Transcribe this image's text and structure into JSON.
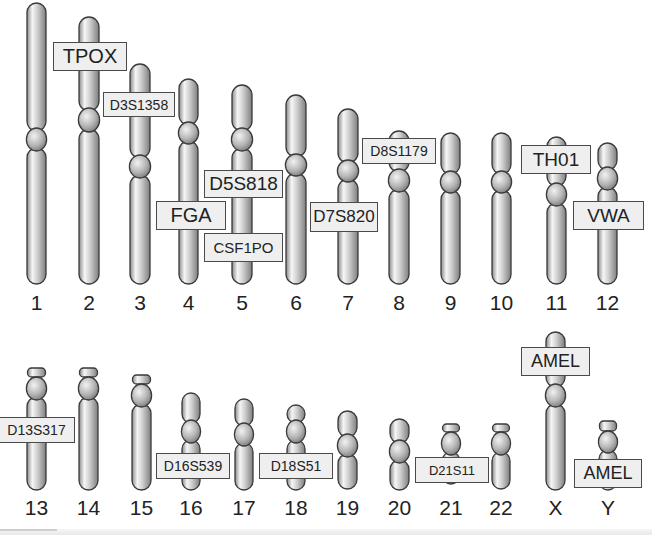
{
  "diagram": {
    "title": "",
    "colors": {
      "chromosome_light": "#f4f4f4",
      "chromosome_mid": "#bdbdbd",
      "chromosome_dark": "#8c8c8c",
      "outline": "#3a3a3a",
      "label_fill": "#efefef",
      "label_border": "#4a4a4a",
      "text": "#222222"
    },
    "chromosomes": [
      {
        "id": "1",
        "label": "1",
        "x": 27,
        "w": 19,
        "segments": [
          {
            "t": "arm",
            "y1": 3,
            "y2": 131
          },
          {
            "t": "cen",
            "y1": 128,
            "y2": 151
          },
          {
            "t": "arm",
            "y1": 148,
            "y2": 284
          }
        ],
        "num_y": 292
      },
      {
        "id": "2",
        "label": "2",
        "x": 79,
        "w": 20,
        "segments": [
          {
            "t": "arm",
            "y1": 17,
            "y2": 111
          },
          {
            "t": "cen",
            "y1": 108,
            "y2": 132
          },
          {
            "t": "arm",
            "y1": 129,
            "y2": 284
          }
        ],
        "num_y": 292
      },
      {
        "id": "3",
        "label": "3",
        "x": 130,
        "w": 20,
        "segments": [
          {
            "t": "arm",
            "y1": 64,
            "y2": 158
          },
          {
            "t": "cen",
            "y1": 155,
            "y2": 178
          },
          {
            "t": "arm",
            "y1": 175,
            "y2": 284
          }
        ],
        "num_y": 292
      },
      {
        "id": "4",
        "label": "4",
        "x": 179,
        "w": 19,
        "segments": [
          {
            "t": "arm",
            "y1": 79,
            "y2": 125
          },
          {
            "t": "cen",
            "y1": 122,
            "y2": 144
          },
          {
            "t": "arm",
            "y1": 141,
            "y2": 284
          }
        ],
        "num_y": 292
      },
      {
        "id": "5",
        "label": "5",
        "x": 232,
        "w": 20,
        "segments": [
          {
            "t": "arm",
            "y1": 85,
            "y2": 131
          },
          {
            "t": "cen",
            "y1": 128,
            "y2": 151
          },
          {
            "t": "arm",
            "y1": 148,
            "y2": 284
          }
        ],
        "num_y": 292
      },
      {
        "id": "6",
        "label": "6",
        "x": 286,
        "w": 20,
        "segments": [
          {
            "t": "arm",
            "y1": 95,
            "y2": 157
          },
          {
            "t": "cen",
            "y1": 154,
            "y2": 176
          },
          {
            "t": "arm",
            "y1": 173,
            "y2": 284
          }
        ],
        "num_y": 292
      },
      {
        "id": "7",
        "label": "7",
        "x": 338,
        "w": 20,
        "segments": [
          {
            "t": "arm",
            "y1": 109,
            "y2": 163
          },
          {
            "t": "cen",
            "y1": 160,
            "y2": 182
          },
          {
            "t": "arm",
            "y1": 179,
            "y2": 284
          }
        ],
        "num_y": 292
      },
      {
        "id": "8",
        "label": "8",
        "x": 389,
        "w": 20,
        "segments": [
          {
            "t": "arm",
            "y1": 131,
            "y2": 172
          },
          {
            "t": "cen",
            "y1": 169,
            "y2": 192
          },
          {
            "t": "arm",
            "y1": 189,
            "y2": 284
          }
        ],
        "num_y": 292
      },
      {
        "id": "9",
        "label": "9",
        "x": 441,
        "w": 19,
        "segments": [
          {
            "t": "arm",
            "y1": 133,
            "y2": 174
          },
          {
            "t": "cen",
            "y1": 171,
            "y2": 193
          },
          {
            "t": "arm",
            "y1": 190,
            "y2": 284
          }
        ],
        "num_y": 292
      },
      {
        "id": "10",
        "label": "10",
        "x": 492,
        "w": 19,
        "segments": [
          {
            "t": "arm",
            "y1": 133,
            "y2": 174
          },
          {
            "t": "cen",
            "y1": 171,
            "y2": 193
          },
          {
            "t": "arm",
            "y1": 190,
            "y2": 284
          }
        ],
        "num_y": 292
      },
      {
        "id": "11",
        "label": "11",
        "x": 547,
        "w": 19,
        "segments": [
          {
            "t": "arm",
            "y1": 137,
            "y2": 186
          },
          {
            "t": "cen",
            "y1": 183,
            "y2": 206
          },
          {
            "t": "arm",
            "y1": 203,
            "y2": 284
          }
        ],
        "num_y": 292
      },
      {
        "id": "12",
        "label": "12",
        "x": 598,
        "w": 19,
        "segments": [
          {
            "t": "arm",
            "y1": 143,
            "y2": 170
          },
          {
            "t": "cen",
            "y1": 167,
            "y2": 190
          },
          {
            "t": "arm",
            "y1": 187,
            "y2": 284
          }
        ],
        "num_y": 292
      },
      {
        "id": "13",
        "label": "13",
        "x": 27,
        "w": 19,
        "segments": [
          {
            "t": "sat",
            "y1": 368,
            "y2": 377
          },
          {
            "t": "cen",
            "y1": 377,
            "y2": 400
          },
          {
            "t": "arm",
            "y1": 397,
            "y2": 490
          }
        ],
        "num_y": 497
      },
      {
        "id": "14",
        "label": "14",
        "x": 79,
        "w": 19,
        "segments": [
          {
            "t": "sat",
            "y1": 368,
            "y2": 377
          },
          {
            "t": "cen",
            "y1": 377,
            "y2": 400
          },
          {
            "t": "arm",
            "y1": 397,
            "y2": 490
          }
        ],
        "num_y": 497
      },
      {
        "id": "15",
        "label": "15",
        "x": 132,
        "w": 19,
        "segments": [
          {
            "t": "sat",
            "y1": 375,
            "y2": 384
          },
          {
            "t": "cen",
            "y1": 384,
            "y2": 407
          },
          {
            "t": "arm",
            "y1": 404,
            "y2": 490
          }
        ],
        "num_y": 497
      },
      {
        "id": "16",
        "label": "16",
        "x": 182,
        "w": 18,
        "segments": [
          {
            "t": "arm",
            "y1": 393,
            "y2": 423
          },
          {
            "t": "cen",
            "y1": 420,
            "y2": 443
          },
          {
            "t": "arm",
            "y1": 440,
            "y2": 490
          }
        ],
        "num_y": 497
      },
      {
        "id": "17",
        "label": "17",
        "x": 235,
        "w": 18,
        "segments": [
          {
            "t": "arm",
            "y1": 399,
            "y2": 426
          },
          {
            "t": "cen",
            "y1": 423,
            "y2": 446
          },
          {
            "t": "arm",
            "y1": 443,
            "y2": 490
          }
        ],
        "num_y": 497
      },
      {
        "id": "18",
        "label": "18",
        "x": 287,
        "w": 18,
        "segments": [
          {
            "t": "arm",
            "y1": 405,
            "y2": 423
          },
          {
            "t": "cen",
            "y1": 420,
            "y2": 443
          },
          {
            "t": "arm",
            "y1": 440,
            "y2": 490
          }
        ],
        "num_y": 497
      },
      {
        "id": "19",
        "label": "19",
        "x": 338,
        "w": 19,
        "segments": [
          {
            "t": "arm",
            "y1": 411,
            "y2": 437
          },
          {
            "t": "cen",
            "y1": 434,
            "y2": 457
          },
          {
            "t": "arm",
            "y1": 454,
            "y2": 489
          }
        ],
        "num_y": 497
      },
      {
        "id": "20",
        "label": "20",
        "x": 390,
        "w": 19,
        "segments": [
          {
            "t": "arm",
            "y1": 419,
            "y2": 443
          },
          {
            "t": "cen",
            "y1": 440,
            "y2": 463
          },
          {
            "t": "arm",
            "y1": 460,
            "y2": 490
          }
        ],
        "num_y": 497
      },
      {
        "id": "21",
        "label": "21",
        "x": 442,
        "w": 18,
        "segments": [
          {
            "t": "sat",
            "y1": 424,
            "y2": 432
          },
          {
            "t": "cen",
            "y1": 432,
            "y2": 455
          },
          {
            "t": "arm",
            "y1": 452,
            "y2": 484
          }
        ],
        "num_y": 497
      },
      {
        "id": "22",
        "label": "22",
        "x": 492,
        "w": 18,
        "segments": [
          {
            "t": "sat",
            "y1": 424,
            "y2": 432
          },
          {
            "t": "cen",
            "y1": 432,
            "y2": 455
          },
          {
            "t": "arm",
            "y1": 452,
            "y2": 489
          }
        ],
        "num_y": 497
      },
      {
        "id": "X",
        "label": "X",
        "x": 546,
        "w": 19,
        "segments": [
          {
            "t": "arm",
            "y1": 332,
            "y2": 387
          },
          {
            "t": "cen",
            "y1": 384,
            "y2": 407
          },
          {
            "t": "arm",
            "y1": 404,
            "y2": 490
          }
        ],
        "num_y": 497
      },
      {
        "id": "Y",
        "label": "Y",
        "x": 599,
        "w": 18,
        "segments": [
          {
            "t": "sat",
            "y1": 421,
            "y2": 431
          },
          {
            "t": "cen",
            "y1": 431,
            "y2": 453
          },
          {
            "t": "arm",
            "y1": 450,
            "y2": 490
          }
        ],
        "num_y": 497
      }
    ],
    "markers": [
      {
        "name": "TPOX",
        "chromosome": "2",
        "x": 53,
        "y": 42,
        "w": 74,
        "h": 29,
        "size": 20
      },
      {
        "name": "D3S1358",
        "chromosome": "3",
        "x": 103,
        "y": 92,
        "w": 72,
        "h": 25,
        "size": 14
      },
      {
        "name": "D5S818",
        "chromosome": "5",
        "x": 204,
        "y": 170,
        "w": 79,
        "h": 28,
        "size": 19
      },
      {
        "name": "FGA",
        "chromosome": "4",
        "x": 156,
        "y": 201,
        "w": 70,
        "h": 29,
        "size": 20
      },
      {
        "name": "CSF1PO",
        "chromosome": "5",
        "x": 204,
        "y": 233,
        "w": 79,
        "h": 29,
        "size": 15
      },
      {
        "name": "D7S820",
        "chromosome": "7",
        "x": 310,
        "y": 202,
        "w": 68,
        "h": 30,
        "size": 17
      },
      {
        "name": "D8S1179",
        "chromosome": "8",
        "x": 362,
        "y": 138,
        "w": 74,
        "h": 26,
        "size": 14
      },
      {
        "name": "TH01",
        "chromosome": "11",
        "x": 521,
        "y": 145,
        "w": 70,
        "h": 29,
        "size": 19
      },
      {
        "name": "VWA",
        "chromosome": "12",
        "x": 573,
        "y": 201,
        "w": 71,
        "h": 29,
        "size": 19
      },
      {
        "name": "D13S317",
        "chromosome": "13",
        "x": -2,
        "y": 417,
        "w": 77,
        "h": 26,
        "size": 14
      },
      {
        "name": "D16S539",
        "chromosome": "16",
        "x": 156,
        "y": 453,
        "w": 74,
        "h": 26,
        "size": 14
      },
      {
        "name": "D18S51",
        "chromosome": "18",
        "x": 259,
        "y": 453,
        "w": 74,
        "h": 26,
        "size": 14
      },
      {
        "name": "D21S11",
        "chromosome": "21",
        "x": 415,
        "y": 457,
        "w": 74,
        "h": 26,
        "size": 13
      },
      {
        "name": "AMEL",
        "chromosome": "X",
        "x": 521,
        "y": 347,
        "w": 69,
        "h": 29,
        "size": 18
      },
      {
        "name": "AMEL",
        "chromosome": "Y",
        "x": 574,
        "y": 459,
        "w": 68,
        "h": 29,
        "size": 18
      }
    ]
  }
}
